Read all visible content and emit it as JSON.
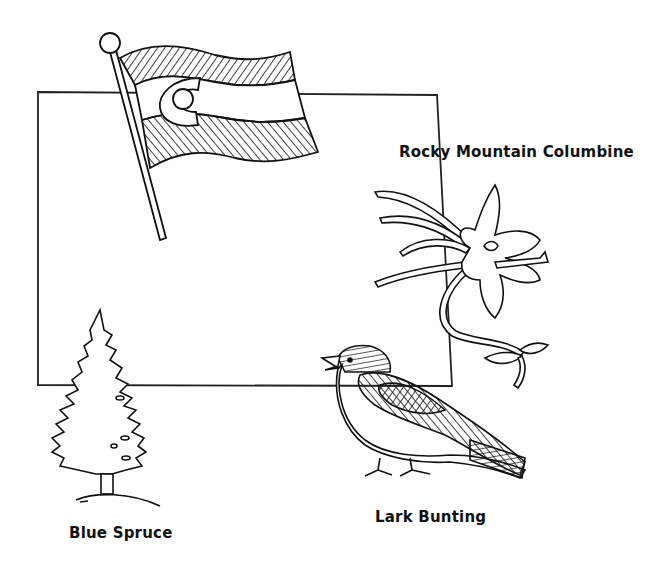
{
  "page": {
    "colors": {
      "ink": "#111111",
      "paper": "#ffffff"
    }
  },
  "state_outline": {
    "shape": "Colorado rectangle"
  },
  "symbols": {
    "flag": {
      "name": "Colorado flag",
      "icon": "flag-icon"
    },
    "flower": {
      "label": "Rocky Mountain Columbine",
      "icon": "columbine-flower-icon"
    },
    "tree": {
      "label": "Blue Spruce",
      "icon": "spruce-tree-icon"
    },
    "bird": {
      "label": "Lark Bunting",
      "icon": "lark-bunting-bird-icon"
    }
  }
}
